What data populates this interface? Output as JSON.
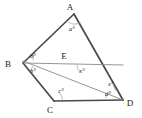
{
  "figure": {
    "width": 142,
    "height": 118,
    "background_color": "#ffffff",
    "stroke_color_main": "#4a4a4a",
    "stroke_color_thin": "#8a8a8a",
    "label_color": "#1a1a1a"
  },
  "vertices": [
    {
      "name": "A",
      "label": "A",
      "x": 74,
      "y": 14
    },
    {
      "name": "B",
      "label": "B",
      "x": 23,
      "y": 63
    },
    {
      "name": "C",
      "label": "C",
      "x": 54,
      "y": 101
    },
    {
      "name": "D",
      "label": "D",
      "x": 123,
      "y": 100
    },
    {
      "name": "E",
      "label": "E",
      "x": 67,
      "y": 62
    }
  ],
  "vertex_label_positions": {
    "A": {
      "x": 70,
      "y": 10
    },
    "B": {
      "x": 8,
      "y": 67
    },
    "C": {
      "x": 50,
      "y": 113
    },
    "D": {
      "x": 128,
      "y": 106
    },
    "E": {
      "x": 62,
      "y": 59
    }
  },
  "angles": [
    {
      "name": "angle-at-a",
      "label": "a°",
      "x": 72,
      "y": 31,
      "vertex": "A"
    },
    {
      "name": "angle-at-b-upper",
      "label": "b°",
      "x": 32,
      "y": 58,
      "vertex": "B"
    },
    {
      "name": "angle-at-b-lower",
      "label": "b°",
      "x": 32,
      "y": 72,
      "vertex": "B"
    },
    {
      "name": "angle-at-c",
      "label": "c°",
      "x": 60,
      "y": 93,
      "vertex": "C"
    },
    {
      "name": "angle-at-e",
      "label": "x°",
      "x": 81,
      "y": 72,
      "vertex": "E"
    },
    {
      "name": "angle-at-d-upper",
      "label": "e°",
      "x": 110,
      "y": 85,
      "vertex": "D"
    },
    {
      "name": "angle-at-d-lower",
      "label": "d°",
      "x": 108,
      "y": 95,
      "vertex": "D"
    }
  ],
  "segments": [
    {
      "name": "segment-ba",
      "from": "B",
      "to": "A",
      "weight": "main"
    },
    {
      "name": "segment-ad",
      "from": "A",
      "to": "D",
      "weight": "main"
    },
    {
      "name": "segment-bc",
      "from": "B",
      "to": "C",
      "weight": "main"
    },
    {
      "name": "segment-cd",
      "from": "C",
      "to": "D",
      "weight": "main"
    },
    {
      "name": "segment-bed",
      "from": "B",
      "to": "D",
      "weight": "thin",
      "note": "horizontal through E"
    },
    {
      "name": "segment-b-to-d-diagonal",
      "from": "B",
      "to": "D",
      "weight": "thin",
      "note": "diagonal crossing at E"
    }
  ]
}
